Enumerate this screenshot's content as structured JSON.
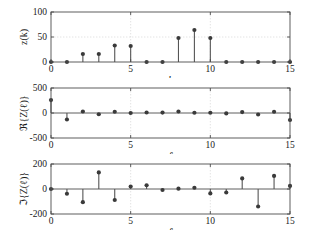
{
  "figure": {
    "type": "stem-plot-figure",
    "background": "#ffffff",
    "marker_color": "#3a3a3a",
    "stem_color": "#555555",
    "axis_color": "#4d4d4d",
    "grid_color": "#d0d0d0"
  },
  "chart_data": [
    {
      "type": "line",
      "plot_style": "stem",
      "id": "panel-1",
      "title": "",
      "xlabel": "k",
      "ylabel": "z(k)",
      "xlim": [
        0,
        15
      ],
      "ylim": [
        0,
        100
      ],
      "xticks": [
        0,
        5,
        10,
        15
      ],
      "xticklabels": [
        "0",
        "5",
        "10",
        "15"
      ],
      "yticks": [
        0,
        50,
        100
      ],
      "yticklabels": [
        "0",
        "50",
        "100"
      ],
      "grid": true,
      "legend": "none",
      "x": [
        0,
        1,
        2,
        3,
        4,
        5,
        6,
        7,
        8,
        9,
        10,
        11,
        12,
        13,
        14,
        15
      ],
      "values": [
        0,
        0,
        16,
        16,
        33,
        32,
        0,
        0,
        48,
        64,
        48,
        0,
        0,
        0,
        0,
        0
      ]
    },
    {
      "type": "line",
      "plot_style": "stem",
      "id": "panel-2",
      "title": "",
      "xlabel": "ℓ",
      "ylabel": "ℜ{Z(ℓ)}",
      "xlim": [
        0,
        15
      ],
      "ylim": [
        -500,
        500
      ],
      "xticks": [
        0,
        5,
        10,
        15
      ],
      "xticklabels": [
        "0",
        "5",
        "10",
        "15"
      ],
      "yticks": [
        -500,
        0,
        500
      ],
      "yticklabels": [
        "-500",
        "0",
        "500"
      ],
      "grid": true,
      "legend": "none",
      "x": [
        0,
        1,
        2,
        3,
        4,
        5,
        6,
        7,
        8,
        9,
        10,
        11,
        12,
        13,
        14,
        15
      ],
      "values": [
        258,
        -130,
        30,
        -25,
        25,
        0,
        10,
        8,
        30,
        5,
        5,
        -8,
        18,
        -30,
        25,
        -140
      ]
    },
    {
      "type": "line",
      "plot_style": "stem",
      "id": "panel-3",
      "title": "",
      "xlabel": "ℓ",
      "ylabel": "ℑ{Z(ℓ)}",
      "xlim": [
        0,
        15
      ],
      "ylim": [
        -200,
        200
      ],
      "xticks": [
        0,
        5,
        10,
        15
      ],
      "xticklabels": [
        "0",
        "5",
        "10",
        "15"
      ],
      "yticks": [
        -200,
        0,
        200
      ],
      "yticklabels": [
        "-200",
        "0",
        "200"
      ],
      "grid": true,
      "legend": "none",
      "x": [
        0,
        1,
        2,
        3,
        4,
        5,
        6,
        7,
        8,
        9,
        10,
        11,
        12,
        13,
        14,
        15
      ],
      "values": [
        0,
        -38,
        -105,
        133,
        -88,
        20,
        30,
        -8,
        3,
        10,
        -35,
        -28,
        85,
        -140,
        105,
        25
      ]
    }
  ]
}
